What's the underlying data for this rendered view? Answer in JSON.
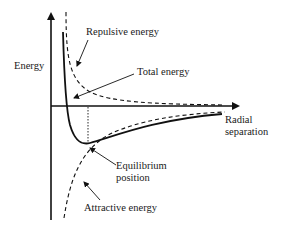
{
  "diagram": {
    "axes": {
      "y_label": "Energy",
      "x_label_line1": "Radial",
      "x_label_line2": "separation"
    },
    "curves": [
      {
        "name": "Repulsive energy",
        "style": "dashed"
      },
      {
        "name": "Total energy",
        "style": "solid"
      },
      {
        "name": "Attractive energy",
        "style": "dashed"
      }
    ],
    "labels": {
      "repulsive": "Repulsive energy",
      "total": "Total energy",
      "equilibrium_line1": "Equilibrium",
      "equilibrium_line2": "position",
      "attractive": "Attractive energy"
    },
    "colors": {
      "line": "#111111",
      "background": "#ffffff"
    }
  }
}
